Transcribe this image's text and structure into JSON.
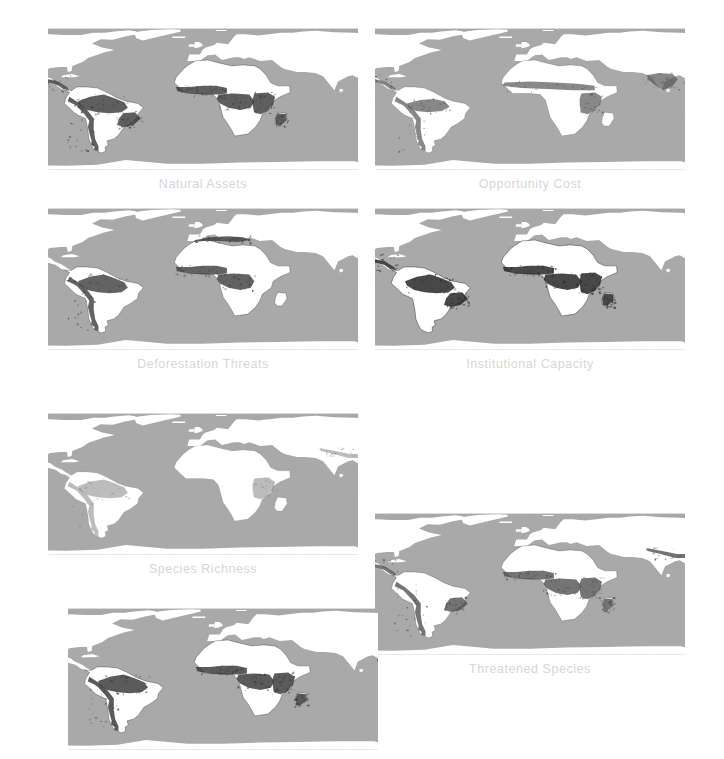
{
  "figure": {
    "background_color": "#ffffff",
    "caption_color": "#d6d6d6",
    "ocean_color": "#a9a9a9",
    "land_color": "#ffffff",
    "projection": "eckert-iv-world-map",
    "panel_count": 7
  },
  "panels": [
    {
      "id": "natural-assets",
      "label": "Natural Assets",
      "has_label": true,
      "x": 48,
      "y": 28,
      "w": 310,
      "h": 142,
      "overlay_intensity": "high",
      "overlay_color": "#3a3a3a",
      "hotspots": [
        "central-america",
        "andes",
        "amazon",
        "atlantic-forest",
        "west-africa",
        "congo-basin",
        "east-africa",
        "madagascar",
        "indochina",
        "south-china",
        "indonesia"
      ]
    },
    {
      "id": "opportunity-cost",
      "label": "Opportunity Cost",
      "has_label": true,
      "x": 375,
      "y": 28,
      "w": 310,
      "h": 142,
      "overlay_intensity": "medium",
      "overlay_color": "#565656",
      "hotspots": [
        "central-america",
        "andes",
        "amazon-fringe",
        "sahel",
        "east-africa",
        "india",
        "south-china",
        "indochina",
        "indonesia",
        "philippines"
      ]
    },
    {
      "id": "deforestation-threats",
      "label": "Deforestation Threats",
      "has_label": true,
      "x": 48,
      "y": 208,
      "w": 310,
      "h": 142,
      "overlay_intensity": "high",
      "overlay_color": "#3f3f3f",
      "hotspots": [
        "amazon",
        "andes",
        "congo-basin",
        "west-africa",
        "indochina",
        "south-china",
        "indonesia",
        "new-guinea",
        "europe-mediterranean"
      ]
    },
    {
      "id": "institutional-capacity",
      "label": "Institutional Capacity",
      "has_label": true,
      "x": 375,
      "y": 208,
      "w": 310,
      "h": 142,
      "overlay_intensity": "very-high",
      "overlay_color": "#2b2b2b",
      "hotspots": [
        "central-america",
        "amazon",
        "atlantic-forest",
        "west-africa",
        "congo-basin",
        "east-africa",
        "madagascar",
        "indochina",
        "indonesia",
        "new-guinea"
      ]
    },
    {
      "id": "species-richness",
      "label": "Species Richness",
      "has_label": true,
      "x": 48,
      "y": 413,
      "w": 310,
      "h": 142,
      "overlay_intensity": "low",
      "overlay_color": "#777777",
      "hotspots": [
        "andes",
        "amazon",
        "east-africa",
        "himalaya",
        "indochina",
        "indonesia",
        "new-guinea"
      ]
    },
    {
      "id": "threatened-species",
      "label": "Threatened Species",
      "has_label": true,
      "x": 375,
      "y": 513,
      "w": 310,
      "h": 142,
      "overlay_intensity": "medium-high",
      "overlay_color": "#494949",
      "hotspots": [
        "central-america",
        "andes",
        "atlantic-forest",
        "west-africa",
        "congo-basin",
        "east-africa",
        "madagascar",
        "himalaya",
        "indochina",
        "indonesia",
        "philippines"
      ]
    },
    {
      "id": "unlabeled-panel",
      "label": "",
      "has_label": false,
      "x": 68,
      "y": 608,
      "w": 310,
      "h": 142,
      "overlay_intensity": "high",
      "overlay_color": "#353535",
      "hotspots": [
        "amazon",
        "andes",
        "west-africa",
        "congo-basin",
        "east-africa",
        "madagascar",
        "indochina",
        "south-china",
        "indonesia",
        "new-guinea"
      ]
    }
  ]
}
